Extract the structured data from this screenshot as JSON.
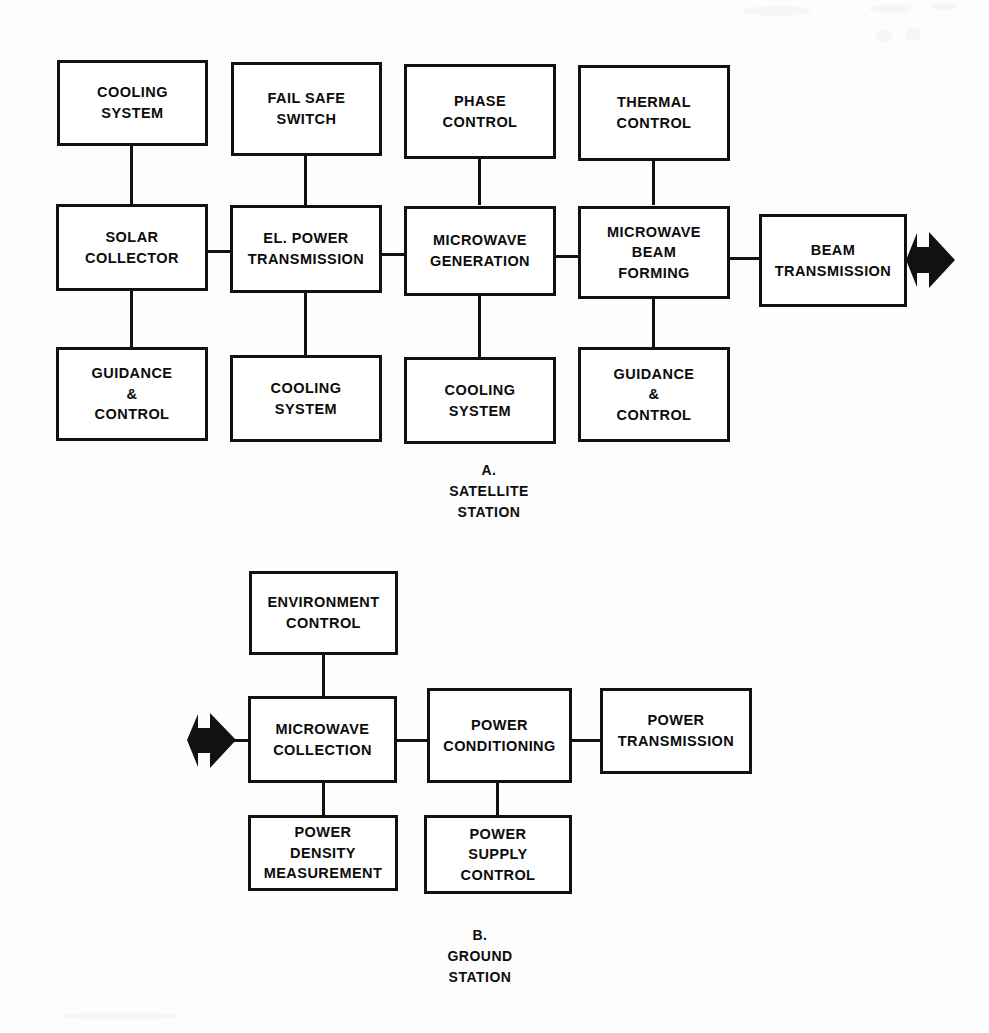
{
  "figure": {
    "kind": "block-diagram",
    "background_color": "#fdfdfd",
    "line_color": "#111111",
    "text_color": "#0c0c0c"
  },
  "sections": [
    {
      "id": "satellite-station",
      "caption": "A.\nSATELLITE\nSTATION",
      "caption_lines": [
        "A.",
        "SATELLITE",
        "STATION"
      ]
    },
    {
      "id": "ground-station",
      "caption": "B.\nGROUND\nSTATION",
      "caption_lines": [
        "B.",
        "GROUND",
        "STATION"
      ]
    }
  ],
  "nodes": {
    "a_cooling_system_1": "COOLING\nSYSTEM",
    "a_fail_safe_switch": "FAIL SAFE\nSWITCH",
    "a_phase_control": "PHASE\nCONTROL",
    "a_thermal_control": "THERMAL\nCONTROL",
    "a_solar_collector": "SOLAR\nCOLLECTOR",
    "a_el_power_transmission": "EL. POWER\nTRANSMISSION",
    "a_microwave_generation": "MICROWAVE\nGENERATION",
    "a_microwave_beam_forming": "MICROWAVE\nBEAM\nFORMING",
    "a_beam_transmission": "BEAM\nTRANSMISSION",
    "a_guidance_control_1": "GUIDANCE\n&\nCONTROL",
    "a_cooling_system_2": "COOLING\nSYSTEM",
    "a_cooling_system_3": "COOLING\nSYSTEM",
    "a_guidance_control_2": "GUIDANCE\n&\nCONTROL",
    "b_environment_control": "ENVIRONMENT\nCONTROL",
    "b_microwave_collection": "MICROWAVE\nCOLLECTION",
    "b_power_conditioning": "POWER\nCONDITIONING",
    "b_power_transmission": "POWER\nTRANSMISSION",
    "b_power_density_measurement": "POWER\nDENSITY\nMEASUREMENT",
    "b_power_supply_control": "POWER\nSUPPLY\nCONTROL"
  },
  "connections": [
    {
      "from": "a_cooling_system_1",
      "to": "a_solar_collector",
      "orientation": "vertical"
    },
    {
      "from": "a_fail_safe_switch",
      "to": "a_el_power_transmission",
      "orientation": "vertical"
    },
    {
      "from": "a_phase_control",
      "to": "a_microwave_generation",
      "orientation": "vertical"
    },
    {
      "from": "a_thermal_control",
      "to": "a_microwave_beam_forming",
      "orientation": "vertical"
    },
    {
      "from": "a_solar_collector",
      "to": "a_el_power_transmission",
      "orientation": "horizontal"
    },
    {
      "from": "a_el_power_transmission",
      "to": "a_microwave_generation",
      "orientation": "horizontal"
    },
    {
      "from": "a_microwave_generation",
      "to": "a_microwave_beam_forming",
      "orientation": "horizontal"
    },
    {
      "from": "a_microwave_beam_forming",
      "to": "a_beam_transmission",
      "orientation": "horizontal"
    },
    {
      "from": "a_solar_collector",
      "to": "a_guidance_control_1",
      "orientation": "vertical"
    },
    {
      "from": "a_el_power_transmission",
      "to": "a_cooling_system_2",
      "orientation": "vertical"
    },
    {
      "from": "a_microwave_generation",
      "to": "a_cooling_system_3",
      "orientation": "vertical"
    },
    {
      "from": "a_microwave_beam_forming",
      "to": "a_guidance_control_2",
      "orientation": "vertical"
    },
    {
      "from": "b_environment_control",
      "to": "b_microwave_collection",
      "orientation": "vertical"
    },
    {
      "from": "b_microwave_collection",
      "to": "b_power_conditioning",
      "orientation": "horizontal"
    },
    {
      "from": "b_power_conditioning",
      "to": "b_power_transmission",
      "orientation": "horizontal"
    },
    {
      "from": "b_microwave_collection",
      "to": "b_power_density_measurement",
      "orientation": "vertical"
    },
    {
      "from": "b_power_conditioning",
      "to": "b_power_supply_control",
      "orientation": "vertical"
    }
  ],
  "arrows": [
    {
      "id": "beam-out-arrow",
      "direction": "right",
      "attached_to": "a_beam_transmission",
      "side": "right"
    },
    {
      "id": "beam-in-arrow",
      "direction": "right",
      "attached_to": "b_microwave_collection",
      "side": "left"
    }
  ]
}
